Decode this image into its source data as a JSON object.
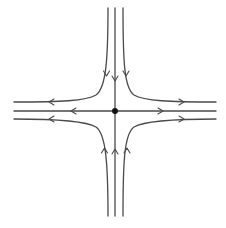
{
  "diagram": {
    "type": "phase-portrait",
    "kind": "saddle-point",
    "colors": {
      "stroke": "#4a4a4a",
      "fixed_point": "#111111",
      "background": "#ffffff"
    },
    "fixed_point": {
      "x": 115,
      "y": 111
    },
    "stable_direction": "vertical (flow toward center)",
    "unstable_direction": "horizontal (flow away from center)",
    "trajectory_count": 8
  }
}
